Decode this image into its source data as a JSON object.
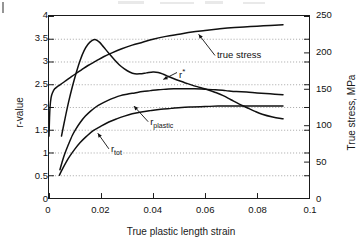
{
  "chart_data": {
    "type": "line",
    "title": "",
    "xlabel": "True plastic length strain",
    "ylabel": "r-value",
    "ylabel_right": "True stress, MPa",
    "xlim": [
      0,
      0.1
    ],
    "ylim": [
      0,
      4
    ],
    "ylim_right": [
      0,
      250
    ],
    "xticks": [
      "0",
      "0.02",
      "0.04",
      "0.06",
      "0.08",
      "0.1"
    ],
    "xtick_values": [
      0,
      0.02,
      0.04,
      0.06,
      0.08,
      0.1
    ],
    "yticks": [
      "0",
      "0.5",
      "1",
      "1.5",
      "2",
      "2.5",
      "3",
      "3.5",
      "4"
    ],
    "ytick_values": [
      0,
      0.5,
      1,
      1.5,
      2,
      2.5,
      3,
      3.5,
      4
    ],
    "yticks_right": [
      "0",
      "50",
      "100",
      "150",
      "200",
      "250"
    ],
    "ytick_right_values": [
      0,
      50,
      100,
      150,
      200,
      250
    ],
    "grid": "horizontal-dotted",
    "legend": "inline-annotations",
    "series": [
      {
        "name": "true stress",
        "axis": "right",
        "units": "MPa",
        "points": [
          [
            0.0,
            85
          ],
          [
            0.0002,
            110
          ],
          [
            0.0004,
            125
          ],
          [
            0.0008,
            138
          ],
          [
            0.0014,
            145
          ],
          [
            0.0022,
            150
          ],
          [
            0.0032,
            153
          ],
          [
            0.0045,
            156
          ],
          [
            0.006,
            160
          ],
          [
            0.008,
            165
          ],
          [
            0.01,
            170
          ],
          [
            0.0125,
            176
          ],
          [
            0.015,
            182
          ],
          [
            0.018,
            188
          ],
          [
            0.021,
            194
          ],
          [
            0.024,
            199
          ],
          [
            0.028,
            205
          ],
          [
            0.032,
            210
          ],
          [
            0.036,
            214
          ],
          [
            0.04,
            218
          ],
          [
            0.045,
            222
          ],
          [
            0.05,
            225
          ],
          [
            0.055,
            228
          ],
          [
            0.06,
            230
          ],
          [
            0.065,
            232
          ],
          [
            0.07,
            234
          ],
          [
            0.075,
            235
          ],
          [
            0.08,
            236
          ],
          [
            0.085,
            237
          ],
          [
            0.09,
            238
          ]
        ]
      },
      {
        "name": "r*",
        "axis": "left",
        "points": [
          [
            0.0048,
            1.36
          ],
          [
            0.006,
            1.7
          ],
          [
            0.0075,
            2.1
          ],
          [
            0.009,
            2.45
          ],
          [
            0.0105,
            2.76
          ],
          [
            0.012,
            3.03
          ],
          [
            0.0135,
            3.24
          ],
          [
            0.015,
            3.38
          ],
          [
            0.0165,
            3.46
          ],
          [
            0.018,
            3.48
          ],
          [
            0.0195,
            3.42
          ],
          [
            0.021,
            3.32
          ],
          [
            0.023,
            3.18
          ],
          [
            0.025,
            3.05
          ],
          [
            0.027,
            2.93
          ],
          [
            0.029,
            2.84
          ],
          [
            0.031,
            2.77
          ],
          [
            0.033,
            2.73
          ],
          [
            0.035,
            2.73
          ],
          [
            0.0375,
            2.75
          ],
          [
            0.04,
            2.77
          ],
          [
            0.042,
            2.76
          ],
          [
            0.044,
            2.72
          ],
          [
            0.046,
            2.67
          ],
          [
            0.049,
            2.6
          ],
          [
            0.052,
            2.54
          ],
          [
            0.055,
            2.48
          ],
          [
            0.058,
            2.43
          ],
          [
            0.061,
            2.38
          ],
          [
            0.064,
            2.32
          ],
          [
            0.067,
            2.25
          ],
          [
            0.07,
            2.16
          ],
          [
            0.073,
            2.07
          ],
          [
            0.076,
            1.99
          ],
          [
            0.079,
            1.91
          ],
          [
            0.082,
            1.84
          ],
          [
            0.086,
            1.78
          ],
          [
            0.09,
            1.74
          ]
        ]
      },
      {
        "name": "r_plastic",
        "axis": "left",
        "points": [
          [
            0.0042,
            0.62
          ],
          [
            0.005,
            0.78
          ],
          [
            0.006,
            0.96
          ],
          [
            0.0075,
            1.18
          ],
          [
            0.009,
            1.38
          ],
          [
            0.0105,
            1.53
          ],
          [
            0.012,
            1.66
          ],
          [
            0.014,
            1.8
          ],
          [
            0.016,
            1.91
          ],
          [
            0.018,
            2.0
          ],
          [
            0.02,
            2.07
          ],
          [
            0.0225,
            2.14
          ],
          [
            0.025,
            2.2
          ],
          [
            0.0275,
            2.25
          ],
          [
            0.03,
            2.28
          ],
          [
            0.033,
            2.31
          ],
          [
            0.036,
            2.34
          ],
          [
            0.039,
            2.36
          ],
          [
            0.042,
            2.38
          ],
          [
            0.045,
            2.39
          ],
          [
            0.048,
            2.4
          ],
          [
            0.052,
            2.4
          ],
          [
            0.056,
            2.4
          ],
          [
            0.06,
            2.39
          ],
          [
            0.064,
            2.38
          ],
          [
            0.068,
            2.36
          ],
          [
            0.072,
            2.34
          ],
          [
            0.076,
            2.33
          ],
          [
            0.08,
            2.31
          ],
          [
            0.085,
            2.29
          ],
          [
            0.09,
            2.27
          ]
        ]
      },
      {
        "name": "r_tot",
        "axis": "left",
        "points": [
          [
            0.004,
            0.5
          ],
          [
            0.005,
            0.62
          ],
          [
            0.0065,
            0.78
          ],
          [
            0.008,
            0.92
          ],
          [
            0.01,
            1.08
          ],
          [
            0.012,
            1.22
          ],
          [
            0.0145,
            1.36
          ],
          [
            0.017,
            1.48
          ],
          [
            0.02,
            1.58
          ],
          [
            0.023,
            1.67
          ],
          [
            0.026,
            1.74
          ],
          [
            0.029,
            1.8
          ],
          [
            0.032,
            1.85
          ],
          [
            0.0355,
            1.89
          ],
          [
            0.039,
            1.92
          ],
          [
            0.043,
            1.95
          ],
          [
            0.047,
            1.97
          ],
          [
            0.051,
            1.99
          ],
          [
            0.055,
            2.0
          ],
          [
            0.06,
            2.01
          ],
          [
            0.065,
            2.02
          ],
          [
            0.07,
            2.02
          ],
          [
            0.075,
            2.02
          ],
          [
            0.08,
            2.02
          ],
          [
            0.085,
            2.02
          ],
          [
            0.09,
            2.02
          ]
        ]
      }
    ],
    "annotations": [
      {
        "id": "true-stress",
        "text": "true stress",
        "label_x": 0.0645,
        "label_y": 3.12,
        "target_x": 0.0575,
        "target_y": 3.58
      },
      {
        "id": "r-star",
        "text": "r*",
        "html": "r<sup>*</sup>",
        "label_x": 0.05,
        "label_y": 2.75,
        "target_x": 0.044,
        "target_y": 2.6
      },
      {
        "id": "r-plastic",
        "text": "rplastic",
        "html": "r<sub>plastic</sub>",
        "label_x": 0.039,
        "label_y": 1.68,
        "target_x": 0.0328,
        "target_y": 2.02
      },
      {
        "id": "r-tot",
        "text": "rtot",
        "html": "r<sub>tot</sub>",
        "label_x": 0.024,
        "label_y": 1.09,
        "target_x": 0.019,
        "target_y": 1.43
      }
    ]
  },
  "axes": {
    "left_title": "r-value",
    "right_title": "True stress, MPa",
    "bottom_title": "True plastic length strain"
  }
}
